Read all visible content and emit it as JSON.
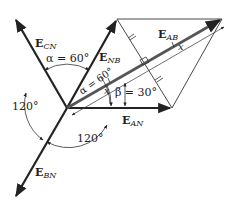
{
  "diagram": {
    "vectors": [
      {
        "id": "E_AN",
        "label_main": "E",
        "label_sub": "AN",
        "angle_deg": 0
      },
      {
        "id": "E_NB",
        "label_main": "E",
        "label_sub": "NB",
        "angle_deg": 60
      },
      {
        "id": "E_CN",
        "label_main": "E",
        "label_sub": "CN",
        "angle_deg": 120
      },
      {
        "id": "E_BN",
        "label_main": "E",
        "label_sub": "BN",
        "angle_deg": 240
      },
      {
        "id": "E_AB",
        "label_main": "E",
        "label_sub": "AB",
        "angle_deg": 30
      }
    ],
    "angles": {
      "alpha_top": "α = 60°",
      "alpha_inner": "α = 60°",
      "beta": "β = 30°",
      "left_120": "120°",
      "bottom_120": "120°",
      "x_label": "x",
      "x_label_right": "x"
    }
  }
}
